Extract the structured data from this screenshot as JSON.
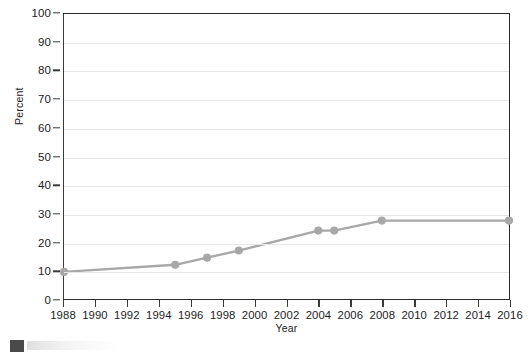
{
  "chart_data": {
    "type": "line",
    "title": "",
    "xlabel": "Year",
    "ylabel": "Percent",
    "xlim": [
      1988,
      2016
    ],
    "ylim": [
      0,
      100
    ],
    "grid": true,
    "legend_position": "none",
    "series_color": "#a8a8a8",
    "x_ticks": [
      1988,
      1990,
      1992,
      1994,
      1996,
      1998,
      2000,
      2002,
      2004,
      2006,
      2008,
      2010,
      2012,
      2014,
      2016
    ],
    "y_ticks": [
      0,
      10,
      20,
      30,
      40,
      50,
      60,
      70,
      80,
      90,
      100
    ],
    "series": [
      {
        "name": "percent-series",
        "points": [
          {
            "x": 1988,
            "y": 9.5
          },
          {
            "x": 1995,
            "y": 12.0
          },
          {
            "x": 1997,
            "y": 14.5
          },
          {
            "x": 1999,
            "y": 17.0
          },
          {
            "x": 2004,
            "y": 24.0
          },
          {
            "x": 2005,
            "y": 24.0
          },
          {
            "x": 2008,
            "y": 27.5
          },
          {
            "x": 2016,
            "y": 27.5
          }
        ]
      }
    ]
  },
  "footer": {
    "swatch_color": "#4a4a4a",
    "caption": ""
  }
}
